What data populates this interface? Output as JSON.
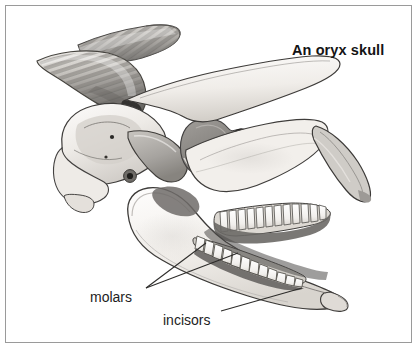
{
  "figure": {
    "title": "An oryx skull",
    "style": "pencil / grayscale scientific illustration",
    "border_color": "#9a9a9a",
    "background_color": "#ffffff"
  },
  "labels": {
    "molars": "molars",
    "incisors": "incisors"
  },
  "annotations": [
    {
      "name": "molars",
      "text": "molars",
      "text_x": 90,
      "text_y": 289,
      "leader_lines": [
        {
          "from_x": 146,
          "from_y": 288,
          "to_x": 205,
          "to_y": 243
        },
        {
          "from_x": 146,
          "from_y": 288,
          "to_x": 237,
          "to_y": 253
        }
      ]
    },
    {
      "name": "incisors",
      "text": "incisors",
      "text_x": 163,
      "text_y": 312,
      "leader_lines": [
        {
          "from_x": 221,
          "from_y": 311,
          "to_x": 300,
          "to_y": 288
        }
      ]
    }
  ],
  "palette": {
    "outline": "#3a3a3a",
    "bone_light": "#f4f2ef",
    "bone_mid": "#dedbd6",
    "bone_shade": "#c3bfba",
    "deep_shadow": "#8e8b87",
    "cavity_dark": "#7d7a77",
    "cavity_darker": "#4e4c4a",
    "horn_light": "#dcdad6",
    "horn_mid": "#b4b1ac",
    "horn_dark": "#6f6d6a",
    "tooth_white": "#fbfaf8",
    "text": "#1d1d1d",
    "title": "#141414"
  },
  "anatomy_parts": [
    "horn (upper/far)",
    "horn (lower/near)",
    "cranium",
    "orbit / eye socket",
    "auditory bulla / ear opening",
    "occipital condyle",
    "zygomatic arch",
    "maxilla",
    "nasal bone",
    "premaxilla",
    "mandible / lower jaw",
    "upper molar row",
    "lower molar row",
    "incisors"
  ]
}
